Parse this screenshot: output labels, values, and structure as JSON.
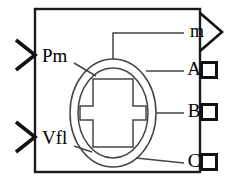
{
  "diagram": {
    "type": "simulink-block",
    "colors": {
      "stroke": "#1a1a1a",
      "symbol_stroke": "#3a3a3a",
      "background": "#ffffff",
      "text": "#000000"
    },
    "body": {
      "name": "block-body-rectangle",
      "x": 35,
      "y": 9,
      "width": 165,
      "height": 163,
      "stroke_width": 2.4
    },
    "machine_symbol": {
      "name": "synchronous-machine-symbol",
      "outer_ellipse": {
        "cx": 113,
        "cy": 113,
        "rx": 43,
        "ry": 54
      },
      "stator_arc": {
        "cx": 113,
        "cy": 113,
        "rx": 35,
        "ry": 45
      },
      "rotor_shape": "i-beam"
    }
  },
  "inputs": [
    {
      "id": "pm",
      "label": "Pm",
      "name": "input-port-pm",
      "port_shape": "chevron",
      "label_x": 42,
      "label_y": 58,
      "port_y": 55
    },
    {
      "id": "vfl",
      "label": "Vfl",
      "name": "input-port-vfl",
      "port_shape": "chevron",
      "label_x": 42,
      "label_y": 140,
      "port_y": 137
    }
  ],
  "outputs": [
    {
      "id": "m",
      "label": "m",
      "name": "output-port-m",
      "port_shape": "triangle",
      "label_x": 192,
      "label_y": 33,
      "port_y": 32
    },
    {
      "id": "a",
      "label": "A",
      "name": "output-port-a",
      "port_shape": "square",
      "label_x": 192,
      "label_y": 71,
      "port_y": 70
    },
    {
      "id": "b",
      "label": "B",
      "name": "output-port-b",
      "port_shape": "square",
      "label_x": 192,
      "label_y": 113,
      "port_y": 112
    },
    {
      "id": "c",
      "label": "C",
      "name": "output-port-c",
      "port_shape": "square",
      "label_x": 192,
      "label_y": 163,
      "port_y": 162
    }
  ]
}
